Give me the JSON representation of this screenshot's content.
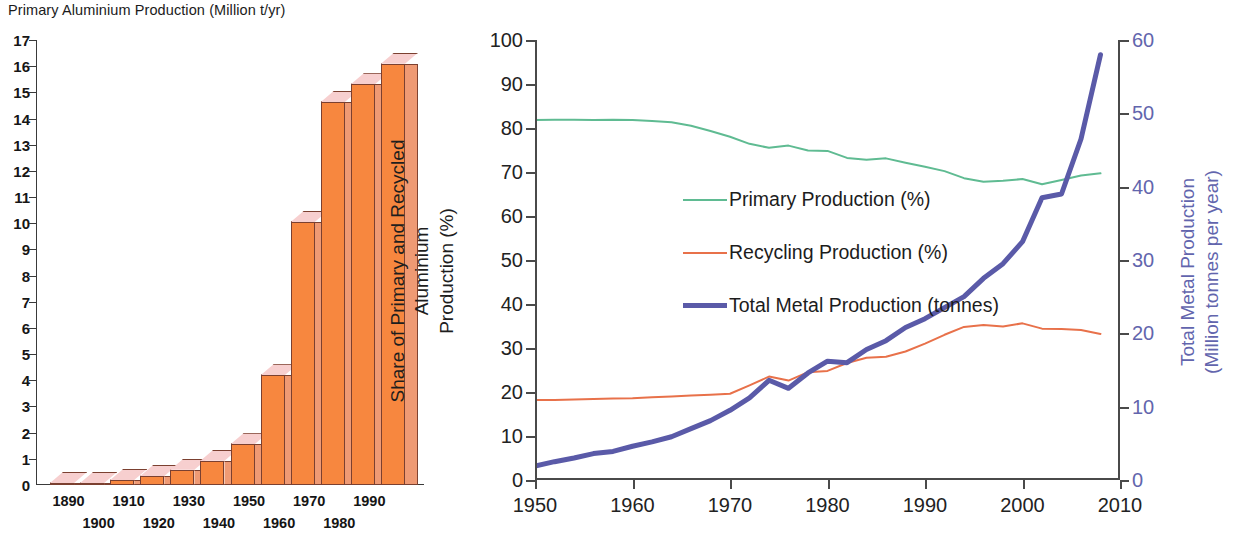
{
  "bar_chart": {
    "title": "Primary Aluminium Production (Million t/yr)",
    "y_ticks": [
      "17",
      "16",
      "15",
      "14",
      "13",
      "12",
      "11",
      "10",
      "9",
      "8",
      "7",
      "6",
      "5",
      "4",
      "3",
      "2",
      "1",
      "0"
    ],
    "x_ticks_top": [
      "1890",
      "1910",
      "1930",
      "1950",
      "1970",
      "1990"
    ],
    "x_ticks_bottom": [
      "1900",
      "1920",
      "1940",
      "1960",
      "1980"
    ],
    "colors": {
      "bar_face": "#f7873f",
      "bar_top": "#f7cfcf",
      "bar_side": "#ef9a74",
      "outline": "#7b4030"
    }
  },
  "line_chart": {
    "y_axis_left_label_line1": "Share of Primary and Recycled Aluminium",
    "y_axis_left_label_line2": "Production (%)",
    "y_axis_right_label_line1": "Total Metal Production",
    "y_axis_right_label_line2": "(Million tonnes per year)",
    "y_ticks_left": [
      "100",
      "90",
      "80",
      "70",
      "60",
      "50",
      "40",
      "30",
      "20",
      "10",
      "0"
    ],
    "y_ticks_right": [
      "60",
      "50",
      "40",
      "30",
      "20",
      "10",
      "0"
    ],
    "x_ticks": [
      "1950",
      "1960",
      "1970",
      "1980",
      "1990",
      "2000",
      "2010"
    ],
    "legend": [
      {
        "label": "Primary Production (%)",
        "color": "#5fbb92"
      },
      {
        "label": "Recycling Production (%)",
        "color": "#e8714a"
      },
      {
        "label": "Total Metal Production (tonnes)",
        "color": "#5a5aa8"
      }
    ]
  },
  "chart_data": [
    {
      "type": "bar",
      "title": "Primary Aluminium Production (Million t/yr)",
      "xlabel": "",
      "ylabel": "Primary Aluminium Production (Million t/yr)",
      "ylim": [
        0,
        17
      ],
      "grid": false,
      "categories": [
        "1890",
        "1900",
        "1910",
        "1920",
        "1930",
        "1940",
        "1950",
        "1960",
        "1970",
        "1980",
        "1990",
        "2000"
      ],
      "values": [
        0.02,
        0.08,
        0.2,
        0.35,
        0.6,
        0.95,
        1.6,
        4.3,
        10.3,
        15.0,
        15.7,
        16.5
      ]
    },
    {
      "type": "line",
      "title": "",
      "xlabel": "",
      "ylabel": "Share of Primary and Recycled Aluminium Production (%)",
      "ylabel_right": "Total Metal Production (Million tonnes per year)",
      "xlim": [
        1950,
        2010
      ],
      "ylim": [
        0,
        100
      ],
      "ylim_right": [
        0,
        60
      ],
      "grid": false,
      "legend_position": "middle-left",
      "x": [
        1950,
        1952,
        1954,
        1956,
        1958,
        1960,
        1962,
        1964,
        1966,
        1968,
        1970,
        1972,
        1974,
        1976,
        1978,
        1980,
        1982,
        1984,
        1986,
        1988,
        1990,
        1992,
        1994,
        1996,
        1998,
        2000,
        2002,
        2004,
        2006,
        2008
      ],
      "series": [
        {
          "name": "Primary Production (%)",
          "axis": "left",
          "color": "#5fbb92",
          "units": "%",
          "values": [
            81.8,
            81.9,
            81.9,
            81.8,
            81.9,
            81.8,
            81.6,
            81.3,
            80.5,
            79.3,
            78.0,
            76.4,
            75.5,
            76.0,
            74.9,
            74.8,
            73.2,
            72.8,
            73.1,
            72.1,
            71.2,
            70.2,
            68.6,
            67.8,
            68.0,
            68.4,
            67.2,
            68.2,
            69.2,
            69.7
          ]
        },
        {
          "name": "Recycling Production (%)",
          "axis": "left",
          "color": "#e8714a",
          "units": "%",
          "values": [
            18.2,
            18.2,
            18.3,
            18.4,
            18.5,
            18.6,
            18.8,
            19.0,
            19.2,
            19.4,
            19.6,
            21.5,
            23.5,
            22.6,
            24.5,
            24.8,
            26.6,
            27.8,
            28.0,
            29.2,
            31.0,
            33.0,
            34.8,
            35.2,
            34.9,
            35.6,
            34.4,
            34.3,
            34.1,
            33.2
          ]
        },
        {
          "name": "Total Metal Production (tonnes)",
          "axis": "right",
          "color": "#5a5aa8",
          "units": "Million tonnes per year",
          "values": [
            1.9,
            2.5,
            3.0,
            3.6,
            3.9,
            4.6,
            5.2,
            5.9,
            7.0,
            8.1,
            9.5,
            11.2,
            13.6,
            12.5,
            14.6,
            16.2,
            16.0,
            17.8,
            19.0,
            20.8,
            22.0,
            23.5,
            25.0,
            27.5,
            29.5,
            32.5,
            38.5,
            39.0,
            46.5,
            58.0
          ]
        }
      ]
    }
  ]
}
